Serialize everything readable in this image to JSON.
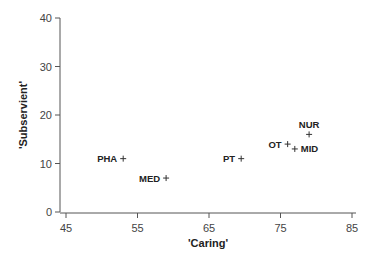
{
  "chart_data": {
    "type": "scatter",
    "title": "",
    "xlabel": "'Caring'",
    "ylabel": "'Subservient'",
    "xlim": [
      45,
      85
    ],
    "ylim": [
      0,
      40
    ],
    "xticks": [
      45,
      55,
      65,
      75,
      85
    ],
    "yticks": [
      0,
      10,
      20,
      30,
      40
    ],
    "grid": false,
    "legend": null,
    "marker": "+",
    "points": [
      {
        "label": "PHA",
        "x": 53,
        "y": 11,
        "label_side": "left"
      },
      {
        "label": "MED",
        "x": 59,
        "y": 7,
        "label_side": "left"
      },
      {
        "label": "PT",
        "x": 69.5,
        "y": 11,
        "label_side": "left"
      },
      {
        "label": "OT",
        "x": 76,
        "y": 14,
        "label_side": "left"
      },
      {
        "label": "MID",
        "x": 77,
        "y": 13,
        "label_side": "right"
      },
      {
        "label": "NUR",
        "x": 79,
        "y": 16,
        "label_side": "top"
      }
    ]
  }
}
